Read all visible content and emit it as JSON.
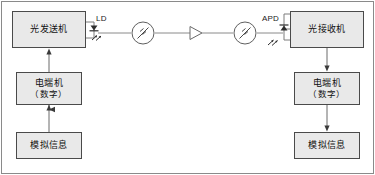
{
  "diagram": {
    "type": "block-diagram",
    "background": "#ffffff",
    "frame_color": "#8a8a8a",
    "node_fill": "#e9e9e9",
    "node_stroke": "#4a4a4a",
    "line_color": "#555555"
  },
  "nodes": {
    "optical_transmitter": {
      "label": "光发送机"
    },
    "optical_receiver": {
      "label": "光接收机"
    },
    "terminal_left": {
      "line1": "电端机",
      "line2": "（数字）"
    },
    "terminal_right": {
      "line1": "电端机",
      "line2": "（数字）"
    },
    "analog_signal_left": {
      "label": "模拟信息"
    },
    "analog_signal_right": {
      "label": "模拟信息"
    }
  },
  "components": {
    "ld": {
      "label": "LD",
      "name": "laser-diode"
    },
    "apd": {
      "label": "APD",
      "name": "avalanche-photodiode"
    },
    "connector_left": {
      "name": "optical-connector-left"
    },
    "connector_right": {
      "name": "optical-connector-right"
    },
    "repeater": {
      "name": "optical-repeater-amplifier"
    }
  },
  "flow": {
    "left_up_1": "模拟信息 → 电端机（数字）",
    "left_up_2": "电端机（数字） → 光发送机",
    "right_down_1": "光接收机 → 电端机（数字）",
    "right_down_2": "电端机（数字） → 模拟信息",
    "optical_path": "LD → 连接器 → 中继器 → 连接器 → APD"
  }
}
